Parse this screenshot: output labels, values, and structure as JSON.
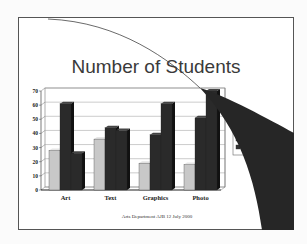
{
  "slide": {
    "title": "Number of Students",
    "footer": "Arts Department AJB 12 July 2000"
  },
  "legend": {
    "items": [
      {
        "label": "",
        "swatch": "light"
      },
      {
        "label": "TE",
        "swatch": "dark"
      },
      {
        "label": "TE",
        "swatch": "dark"
      }
    ]
  },
  "colors": {
    "light_bar": "#c8c8c8",
    "dark_bar": "#2a2a2a",
    "curl": "#262626",
    "frame": "#555555"
  },
  "chart_data": {
    "type": "bar",
    "title": "Number of Students",
    "categories": [
      "Art",
      "Text",
      "Graphics",
      "Photo"
    ],
    "series": [
      {
        "name": "Series 1 (light)",
        "values": [
          28,
          36,
          19,
          18
        ]
      },
      {
        "name": "Series 2 (dark)",
        "values": [
          61,
          44,
          39,
          51
        ]
      },
      {
        "name": "Series 3 (dark)",
        "values": [
          26,
          42,
          61,
          70
        ]
      }
    ],
    "xlabel": "",
    "ylabel": "",
    "ylim": [
      0,
      70
    ],
    "yticks": [
      0,
      10,
      20,
      30,
      40,
      50,
      60,
      70
    ],
    "grid": true,
    "legend_position": "right (partially obscured by page curl)",
    "style": "3D clustered column"
  }
}
